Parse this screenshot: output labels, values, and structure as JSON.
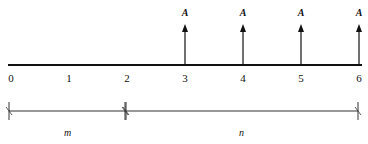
{
  "diagram": {
    "title": "",
    "timeline": {
      "periods": [
        "0",
        "1",
        "2",
        "3",
        "4",
        "5",
        "6"
      ]
    },
    "cash_flows": [
      {
        "period": 3,
        "label": "A",
        "direction": "up"
      },
      {
        "period": 4,
        "label": "A",
        "direction": "up"
      },
      {
        "period": 5,
        "label": "A",
        "direction": "up"
      },
      {
        "period": 6,
        "label": "A",
        "direction": "up"
      }
    ],
    "segments": [
      {
        "from": 0,
        "to": 2,
        "label": "m"
      },
      {
        "from": 2,
        "to": 6,
        "label": "n"
      }
    ]
  }
}
